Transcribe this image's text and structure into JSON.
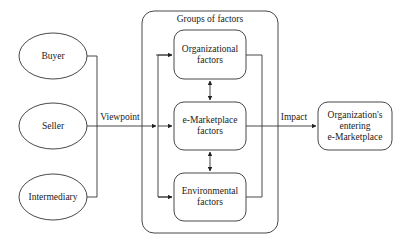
{
  "diagram": {
    "title": "Groups of factors",
    "viewpoints": [
      {
        "label": "Buyer"
      },
      {
        "label": "Seller"
      },
      {
        "label": "Intermediary"
      }
    ],
    "viewpoint_edge_label": "Viewpoint",
    "factors": [
      {
        "line1": "Organizational",
        "line2": "factors"
      },
      {
        "line1": "e-Marketplace",
        "line2": "factors"
      },
      {
        "line1": "Environmental",
        "line2": "factors"
      }
    ],
    "impact_edge_label": "Impact",
    "outcome": {
      "line1": "Organization's",
      "line2": "entering",
      "line3": "e-Marketplace"
    },
    "colors": {
      "stroke": "#333333",
      "background": "#ffffff",
      "text": "#222222"
    }
  }
}
